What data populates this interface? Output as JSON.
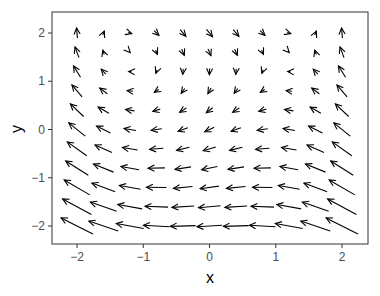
{
  "chart_data": {
    "type": "quiver",
    "title": "",
    "xlabel": "x",
    "ylabel": "y",
    "xlim": [
      -2.4,
      2.4
    ],
    "ylim": [
      -2.4,
      2.4
    ],
    "x_ticks": [
      -2,
      -1,
      0,
      1,
      2
    ],
    "y_ticks": [
      -2,
      -1,
      0,
      1,
      2
    ],
    "x_tick_labels": [
      "−2",
      "−1",
      "0",
      "1",
      "2"
    ],
    "y_tick_labels": [
      "−2",
      "−1",
      "0",
      "1",
      "2"
    ],
    "grid": false,
    "legend": null,
    "grid_points": {
      "x": [
        -2,
        -1.6,
        -1.2,
        -0.8,
        -0.4,
        0,
        0.4,
        0.8,
        1.2,
        1.6,
        2
      ],
      "y": [
        -2,
        -1.6,
        -1.2,
        -0.8,
        -0.4,
        0,
        0.4,
        0.8,
        1.2,
        1.6,
        2
      ]
    },
    "field_description": "Arrows centered on an 11x11 grid. Top row flows right (down-right in the middle), bottom rows flow strongly left, left/right edge columns flow upward (up-left toward bottom), center flows left-down forming a clockwise-like circulation.",
    "field_approx": {
      "u": "0.45*y - 0.55 - 0.1*x^2",
      "v": "0.35*x^2 - 0.35 - 0.12*y"
    },
    "arrow_color": "#000000",
    "panel_border_color": "#333333"
  }
}
